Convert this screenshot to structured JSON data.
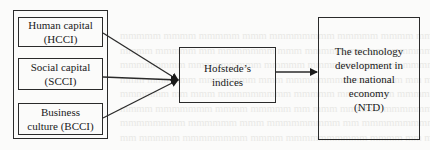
{
  "diagram": {
    "inputs": [
      {
        "id": "hcci",
        "label": "Human capital\n(HCCI)"
      },
      {
        "id": "scci",
        "label": "Social capital\n(SCCI)"
      },
      {
        "id": "bcci",
        "label": "Business\nculture (BCCI)"
      }
    ],
    "mediator": {
      "label": "Hofstede’s\nindices"
    },
    "outcome": {
      "label": "The technology\ndevelopment in\nthe national\neconomy\n(NTD)"
    },
    "edges": [
      {
        "from": "hcci",
        "to": "mediator"
      },
      {
        "from": "scci",
        "to": "mediator"
      },
      {
        "from": "bcci",
        "to": "mediator"
      },
      {
        "from": "mediator",
        "to": "outcome"
      }
    ],
    "colors": {
      "line": "#2a2a2a",
      "background": "#fbfbfa"
    }
  }
}
